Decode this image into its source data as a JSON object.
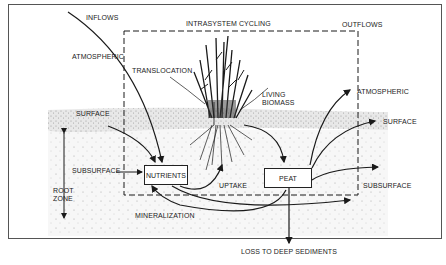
{
  "diagram": {
    "headers": {
      "inflows": "INFLOWS",
      "intrasystem": "INTRASYSTEM CYCLING",
      "outflows": "OUTFLOWS"
    },
    "inflow_labels": {
      "atmospheric": "ATMOSPHERIC",
      "surface": "SURFACE",
      "subsurface": "SUBSURFACE"
    },
    "root_zone": {
      "line1": "ROOT",
      "line2": "ZONE"
    },
    "process_labels": {
      "translocation": "TRANSLOCATION",
      "living_biomass_1": "LIVING",
      "living_biomass_2": "BIOMASS",
      "uptake": "UPTAKE",
      "mineralization": "MINERALIZATION"
    },
    "boxes": {
      "nutrients": "NUTRIENTS",
      "peat": "PEAT"
    },
    "outflow_labels": {
      "atmospheric": "ATMOSPHERIC",
      "surface": "SURFACE",
      "subsurface": "SUBSURFACE",
      "loss": "LOSS TO DEEP SEDIMENTS"
    },
    "colors": {
      "line": "#1a1a1a",
      "surface_band": "#e6e6e6",
      "soil": "#f4f4f4"
    }
  }
}
